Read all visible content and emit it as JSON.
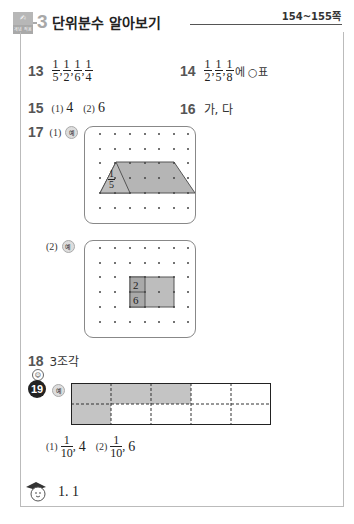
{
  "header": {
    "badge_top": "✍",
    "badge_bottom": "개념 적용",
    "unit_number": "3",
    "title": "단위분수 알아보기",
    "pages": "154~155쪽"
  },
  "answers": {
    "q13": {
      "number": "13",
      "fractions": [
        {
          "n": "1",
          "d": "5"
        },
        {
          "n": "1",
          "d": "2"
        },
        {
          "n": "1",
          "d": "6"
        },
        {
          "n": "1",
          "d": "4"
        }
      ]
    },
    "q14": {
      "number": "14",
      "fractions": [
        {
          "n": "1",
          "d": "2"
        },
        {
          "n": "1",
          "d": "5"
        },
        {
          "n": "1",
          "d": "8"
        }
      ],
      "suffix": "에 ○표"
    },
    "q15": {
      "number": "15",
      "part1_label": "(1)",
      "part1_value": "4",
      "part2_label": "(2)",
      "part2_value": "6"
    },
    "q16": {
      "number": "16",
      "value": "가, 다"
    },
    "q17": {
      "number": "17",
      "part1_label": "(1)",
      "part2_label": "(2)",
      "example_mark": "예",
      "part1_fraction": {
        "n": "1",
        "d": "5"
      },
      "part2_fraction": {
        "n": "2",
        "d": "6"
      },
      "grid": {
        "cols": 7,
        "rows": 6
      }
    },
    "q18": {
      "number": "18",
      "value": "3조각"
    },
    "q19": {
      "number": "19",
      "example_mark": "예",
      "grid": {
        "cols": 5,
        "rows": 2,
        "shaded": [
          [
            0,
            0
          ],
          [
            0,
            1
          ],
          [
            0,
            2
          ],
          [
            1,
            0
          ]
        ]
      },
      "part1_label": "(1)",
      "part1_fraction": {
        "n": "1",
        "d": "10"
      },
      "part1_value": "4",
      "part2_label": "(2)",
      "part2_fraction": {
        "n": "1",
        "d": "10"
      },
      "part2_value": "6"
    },
    "bonus": {
      "value": "1. 1"
    }
  },
  "colors": {
    "shade": "#b5b5b5",
    "accent_gray": "#a8a8a8"
  }
}
